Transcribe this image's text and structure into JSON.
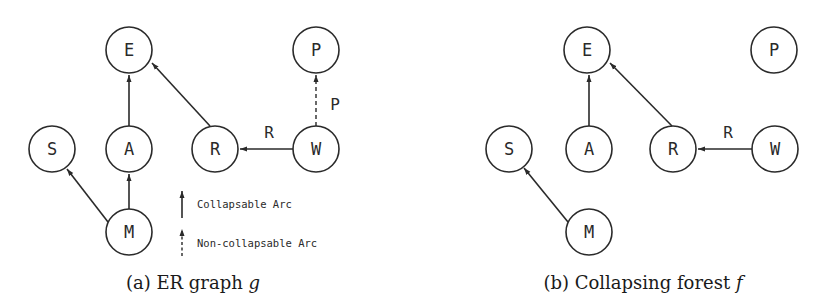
{
  "figure": {
    "panels": [
      {
        "id": "a",
        "caption_prefix": "(a)",
        "caption_text": "ER graph",
        "caption_var": "g",
        "nodes": [
          {
            "id": "E",
            "label": "E",
            "x": 129,
            "y": 50
          },
          {
            "id": "P",
            "label": "P",
            "x": 316,
            "y": 50
          },
          {
            "id": "S",
            "label": "S",
            "x": 52,
            "y": 149
          },
          {
            "id": "A",
            "label": "A",
            "x": 129,
            "y": 149
          },
          {
            "id": "R",
            "label": "R",
            "x": 215,
            "y": 149
          },
          {
            "id": "W",
            "label": "W",
            "x": 316,
            "y": 149
          },
          {
            "id": "M",
            "label": "M",
            "x": 129,
            "y": 232
          }
        ],
        "edges": [
          {
            "from": "A",
            "to": "E",
            "type": "collapsable",
            "label": ""
          },
          {
            "from": "R",
            "to": "E",
            "type": "collapsable",
            "label": ""
          },
          {
            "from": "W",
            "to": "R",
            "type": "collapsable",
            "label": "R"
          },
          {
            "from": "W",
            "to": "P",
            "type": "non-collapsable",
            "label": "P"
          },
          {
            "from": "M",
            "to": "A",
            "type": "collapsable",
            "label": ""
          },
          {
            "from": "M",
            "to": "S",
            "type": "collapsable",
            "label": ""
          }
        ],
        "edge_labels": {
          "R": "R",
          "P": "P"
        }
      },
      {
        "id": "b",
        "caption_prefix": "(b)",
        "caption_text": "Collapsing forest",
        "caption_var": "f",
        "nodes": [
          {
            "id": "E",
            "label": "E",
            "x": 587,
            "y": 50
          },
          {
            "id": "P",
            "label": "P",
            "x": 774,
            "y": 50
          },
          {
            "id": "S",
            "label": "S",
            "x": 509,
            "y": 149
          },
          {
            "id": "A",
            "label": "A",
            "x": 589,
            "y": 149
          },
          {
            "id": "R",
            "label": "R",
            "x": 673,
            "y": 149
          },
          {
            "id": "W",
            "label": "W",
            "x": 775,
            "y": 149
          },
          {
            "id": "M",
            "label": "M",
            "x": 589,
            "y": 232
          }
        ],
        "edges": [
          {
            "from": "A",
            "to": "E",
            "type": "collapsable",
            "label": ""
          },
          {
            "from": "R",
            "to": "E",
            "type": "collapsable",
            "label": ""
          },
          {
            "from": "W",
            "to": "R",
            "type": "collapsable",
            "label": "R"
          },
          {
            "from": "M",
            "to": "S",
            "type": "collapsable",
            "label": ""
          }
        ],
        "edge_labels": {
          "R": "R"
        }
      }
    ],
    "legend": {
      "collapsable": "Collapsable Arc",
      "non_collapsable": "Non-collapsable Arc"
    },
    "colors": {
      "stroke": "#2a2a2a",
      "background": "#ffffff"
    }
  }
}
